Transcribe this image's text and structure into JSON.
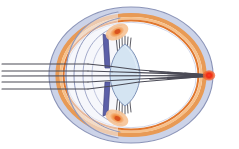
{
  "diagram": {
    "title": "Human eye cross-section with parallel light rays focusing on the retina",
    "type": "anatomical-cross-section",
    "canvas": {
      "width": 239,
      "height": 149,
      "background": "#ffffff"
    },
    "colors": {
      "background": "#ffffff",
      "sclera_fill": "#ccd3e8",
      "sclera_stroke": "#8b94b8",
      "choroid_outer": "#e89a55",
      "choroid_mid": "#f4b47e",
      "choroid_inner": "#e07a33",
      "retina_line": "#b0b7d2",
      "vitreous_fill": "#ffffff",
      "cornea_stroke": "#8f98bd",
      "aqueous_fill": "#eef1f8",
      "iris_fill": "#5b5fa8",
      "iris_stroke": "#3f4280",
      "ciliary_fill": "#f0a45c",
      "ciliary_core": "#d9521f",
      "zonule_stroke": "#4a4a52",
      "lens_fill": "#d4e4f2",
      "lens_stroke": "#7f93b8",
      "ray_stroke": "#4a4a55",
      "focal_point": "#ee2b18",
      "focal_halo": "#f4622f"
    },
    "parts": [
      {
        "id": "sclera",
        "label": "Sclera",
        "color": "#ccd3e8"
      },
      {
        "id": "choroid",
        "label": "Choroid",
        "color": "#e89a55"
      },
      {
        "id": "retina",
        "label": "Retina",
        "color": "#e07a33"
      },
      {
        "id": "cornea",
        "label": "Cornea",
        "color": "#8f98bd"
      },
      {
        "id": "anterior-chamber",
        "label": "Anterior chamber",
        "color": "#eef1f8"
      },
      {
        "id": "iris-upper",
        "label": "Iris (upper)",
        "color": "#5b5fa8"
      },
      {
        "id": "iris-lower",
        "label": "Iris (lower)",
        "color": "#5b5fa8"
      },
      {
        "id": "ciliary-body-upper",
        "label": "Ciliary body (upper)",
        "color": "#f0a45c"
      },
      {
        "id": "ciliary-body-lower",
        "label": "Ciliary body (lower)",
        "color": "#f0a45c"
      },
      {
        "id": "zonule-fibers-upper",
        "label": "Suspensory ligaments (upper)",
        "color": "#4a4a52"
      },
      {
        "id": "zonule-fibers-lower",
        "label": "Suspensory ligaments (lower)",
        "color": "#4a4a52"
      },
      {
        "id": "lens",
        "label": "Lens",
        "color": "#d4e4f2"
      },
      {
        "id": "vitreous-humour",
        "label": "Vitreous humour",
        "color": "#ffffff"
      },
      {
        "id": "focal-point",
        "label": "Focal point on retina",
        "color": "#ee2b18"
      }
    ],
    "light_rays": {
      "count": 5,
      "color": "#4a4a55",
      "entry_x": 2,
      "entry_y": [
        64,
        71,
        76,
        82,
        89
      ],
      "focus_x": 210,
      "focus_y": 75,
      "description": "Five parallel incoming rays refracted by cornea and lens converging at the fovea"
    },
    "geometry": {
      "globe_center_x": 131,
      "globe_center_y": 75,
      "globe_radius_x": 82,
      "globe_radius_y": 68,
      "cornea_apex_x": 74,
      "lens_center_x": 125,
      "lens_half_height": 31,
      "lens_half_width": 13
    }
  }
}
